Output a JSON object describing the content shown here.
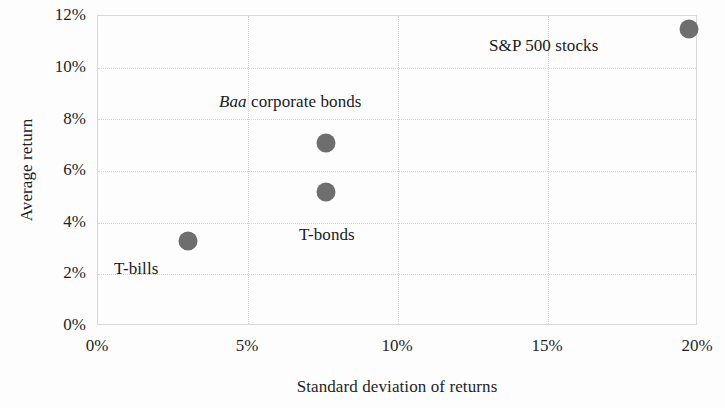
{
  "chart_data": {
    "type": "scatter",
    "title": "",
    "xlabel": "Standard deviation of returns",
    "ylabel": "Average return",
    "xlim": [
      0,
      20
    ],
    "ylim": [
      0,
      12
    ],
    "xticks": [
      "0%",
      "5%",
      "10%",
      "15%",
      "20%"
    ],
    "xtick_values": [
      0,
      5,
      10,
      15,
      20
    ],
    "yticks": [
      "0%",
      "2%",
      "4%",
      "6%",
      "8%",
      "10%",
      "12%"
    ],
    "ytick_values": [
      0,
      2,
      4,
      6,
      8,
      10,
      12
    ],
    "grid": true,
    "legend": "none",
    "units": "percent",
    "marker_color": "#6e6e6e",
    "points": [
      {
        "label": "T-bills",
        "label_plain": "T-bills",
        "label_italic": "",
        "x": 3.0,
        "y": 3.3
      },
      {
        "label": "T-bonds",
        "label_plain": "T-bonds",
        "label_italic": "",
        "x": 7.6,
        "y": 5.2
      },
      {
        "label": "Baa corporate bonds",
        "label_plain": " corporate bonds",
        "label_italic": "Baa",
        "x": 7.6,
        "y": 7.1
      },
      {
        "label": "S&P 500 stocks",
        "label_plain": "S&P 500 stocks",
        "label_italic": "",
        "x": 19.7,
        "y": 11.5
      }
    ]
  },
  "axes": {
    "y_title": "Average return",
    "x_title": "Standard deviation of returns",
    "y_tick_0": "0%",
    "y_tick_1": "2%",
    "y_tick_2": "4%",
    "y_tick_3": "6%",
    "y_tick_4": "8%",
    "y_tick_5": "10%",
    "y_tick_6": "12%",
    "x_tick_0": "0%",
    "x_tick_1": "5%",
    "x_tick_2": "10%",
    "x_tick_3": "15%",
    "x_tick_4": "20%"
  },
  "labels": {
    "sp500": "S&P 500 stocks",
    "baa_italic": "Baa",
    "baa_rest": " corporate bonds",
    "tbonds": "T-bonds",
    "tbills": "T-bills"
  }
}
